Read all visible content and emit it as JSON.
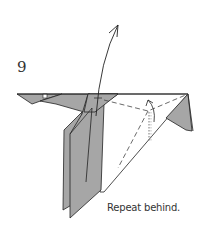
{
  "diagram": {
    "step_number": "9",
    "caption": "Repeat behind.",
    "colors": {
      "paper_colored": "#a6a6a6",
      "paper_white": "#ffffff",
      "line": "#222222",
      "dashed": "#444444",
      "text": "#333333"
    },
    "elements": [
      "left-beak-flap",
      "central-vertical-flaps",
      "large-white-triangle",
      "right-gray-flap",
      "curved-fold-arrow-up",
      "valley-fold-dashed-lines",
      "small-hook-arrow",
      "dotted-vertical-guide"
    ]
  }
}
